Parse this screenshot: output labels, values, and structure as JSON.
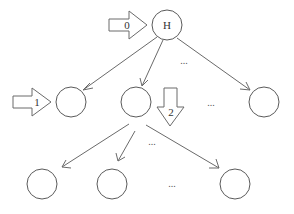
{
  "diagram": {
    "type": "tree-traversal",
    "root": {
      "id": "root",
      "label": "H",
      "cx": 167,
      "cy": 25,
      "r": 15
    },
    "level1": [
      {
        "id": "l1-a",
        "label": "",
        "cx": 71,
        "cy": 102,
        "r": 15
      },
      {
        "id": "l1-b",
        "label": "",
        "cx": 136,
        "cy": 102,
        "r": 15
      },
      {
        "id": "l1-c",
        "label": "",
        "cx": 264,
        "cy": 102,
        "r": 15
      }
    ],
    "level2": [
      {
        "id": "l2-a",
        "label": "",
        "cx": 42,
        "cy": 184,
        "r": 15
      },
      {
        "id": "l2-b",
        "label": "",
        "cx": 112,
        "cy": 184,
        "r": 15
      },
      {
        "id": "l2-c",
        "label": "",
        "cx": 235,
        "cy": 184,
        "r": 15
      }
    ],
    "ellipses": [
      {
        "text": "...",
        "x": 184,
        "y": 64
      },
      {
        "text": "...",
        "x": 211,
        "y": 106
      },
      {
        "text": "...",
        "x": 152,
        "y": 145
      },
      {
        "text": "...",
        "x": 172,
        "y": 187
      }
    ],
    "step_arrows": [
      {
        "label": "0",
        "direction": "right",
        "target": "root"
      },
      {
        "label": "1",
        "direction": "right",
        "target": "l1-a"
      },
      {
        "label": "2",
        "direction": "down",
        "target": "l1-b"
      }
    ],
    "colors": {
      "stroke": "#5a5a5a",
      "background": "#ffffff",
      "text": "#333333"
    }
  }
}
